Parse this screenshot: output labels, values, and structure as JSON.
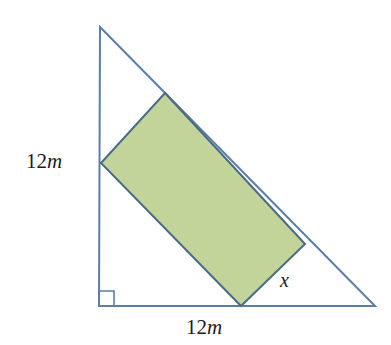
{
  "figure": {
    "background_color": "#ffffff",
    "triangle": {
      "name": "right-triangle",
      "stroke_color": "#5b7ea8",
      "stroke_width": 2,
      "fill_color": "none",
      "vertices": {
        "apex": {
          "x": 100,
          "y": 27
        },
        "bottom_left": {
          "x": 99,
          "y": 306
        },
        "bottom_right": {
          "x": 375,
          "y": 306
        }
      },
      "right_angle_marker": {
        "name": "right-angle-marker",
        "at_vertex": "bottom_left",
        "size": 15,
        "stroke_color": "#5b7ea8"
      }
    },
    "rectangle": {
      "name": "inscribed-rectangle",
      "fill_color": "#c3d49a",
      "stroke_color": "#4a6b85",
      "stroke_width": 2,
      "vertices": {
        "top": {
          "x": 165,
          "y": 93
        },
        "right": {
          "x": 305,
          "y": 244
        },
        "bottom": {
          "x": 241,
          "y": 306
        },
        "left": {
          "x": 101,
          "y": 163
        }
      }
    },
    "labels": {
      "side_left": {
        "number": "12",
        "unit": "m",
        "text": "12m"
      },
      "side_bottom": {
        "number": "12",
        "unit": "m",
        "text": "12m"
      },
      "rectangle_side": {
        "text": "x"
      }
    }
  }
}
